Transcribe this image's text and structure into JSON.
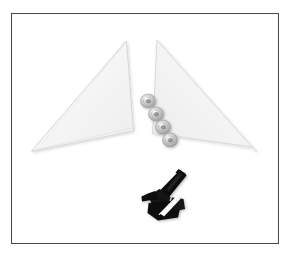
{
  "image": {
    "kind": "product-parts-photograph",
    "subject": "White triangular acrylic panels with mounting washers and a black bracket strap",
    "background_color": "#ffffff",
    "frame": {
      "border_color": "#4a4a4c",
      "border_width_px": 1.5,
      "matte_color": "#fefefe",
      "x": 11,
      "y": 13,
      "width": 268,
      "height": 231
    }
  },
  "objects": [
    {
      "name": "left-triangle-panel",
      "label": "White triangular panel (left)",
      "material": "frosted acrylic",
      "fill_color": "#f7f7f7",
      "edge_color": "#c9c9c9",
      "apex": {
        "x": 126,
        "y": 41
      },
      "outer_bottom": {
        "x": 31,
        "y": 151
      },
      "inner_bottom": {
        "x": 133,
        "y": 130
      }
    },
    {
      "name": "right-triangle-panel",
      "label": "White triangular panel (right)",
      "material": "frosted acrylic",
      "fill_color": "#f6f6f6",
      "edge_color": "#cccccc",
      "apex": {
        "x": 157,
        "y": 40
      },
      "outer_bottom": {
        "x": 256,
        "y": 151
      },
      "inner_bottom": {
        "x": 153,
        "y": 133
      }
    },
    {
      "name": "washer-1",
      "label": "Silver washer 1",
      "body_color": "#d8d8d8",
      "rim_color": "#a8a8a8",
      "hole_color": "#8e8e8e",
      "cx": 148,
      "cy": 101,
      "r": 7.5
    },
    {
      "name": "washer-2",
      "label": "Silver washer 2",
      "body_color": "#d6d6d6",
      "rim_color": "#a5a5a5",
      "hole_color": "#8b8b8b",
      "cx": 156,
      "cy": 114,
      "r": 7.5
    },
    {
      "name": "washer-3",
      "label": "Silver washer 3",
      "body_color": "#d4d4d4",
      "rim_color": "#a2a2a2",
      "hole_color": "#888888",
      "cx": 163,
      "cy": 127,
      "r": 7.5
    },
    {
      "name": "washer-4",
      "label": "Silver washer 4",
      "body_color": "#d2d2d2",
      "rim_color": "#9f9f9f",
      "hole_color": "#858585",
      "cx": 170,
      "cy": 140,
      "r": 7.5
    },
    {
      "name": "black-bracket",
      "label": "Black bracket and strap assembly",
      "body_color": "#111111",
      "highlight_color": "#ffffff",
      "bounds": {
        "x": 141,
        "y": 169,
        "width": 46,
        "height": 52
      }
    }
  ],
  "counts": {
    "panels": 2,
    "washers": 4,
    "brackets": 1
  },
  "palette": {
    "background": "#ffffff",
    "frame_border": "#4a4a4c",
    "panel_fill": "#f7f7f7",
    "panel_edge": "#c9c9c9",
    "washer_body": "#d6d6d6",
    "bracket_black": "#111111",
    "bracket_highlight": "#ffffff"
  },
  "caption": "Two white triangular acrylic panels, four silver washers and a black bracket strap, framed."
}
